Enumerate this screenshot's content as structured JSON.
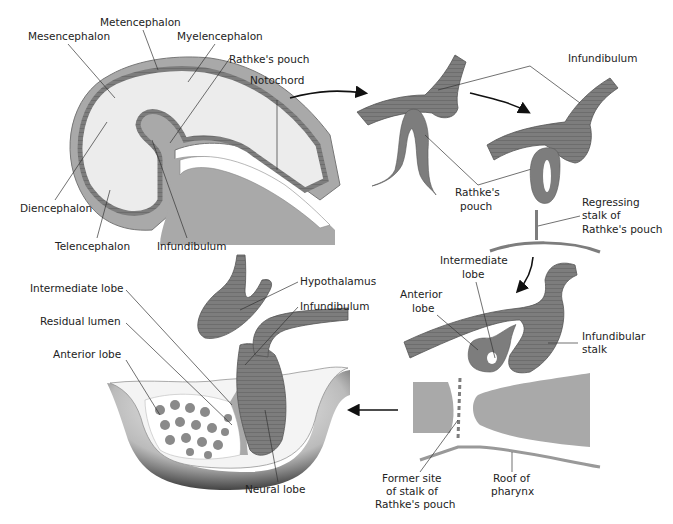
{
  "figure": {
    "panels": {
      "embryo": {
        "labels": {
          "metencephalon": "Metencephalon",
          "mesencephalon": "Mesencephalon",
          "myelencephalon": "Myelencephalon",
          "rathkes_pouch": "Rathke's pouch",
          "notochord": "Notochord",
          "diencephalon": "Diencephalon",
          "telencephalon": "Telencephalon",
          "infundibulum": "Infundibulum"
        }
      },
      "stage2": {
        "labels": {
          "rathkes_pouch_l1": "Rathke's",
          "rathkes_pouch_l2": "pouch"
        }
      },
      "stage3": {
        "labels": {
          "infundibulum": "Infundibulum",
          "regressing_l1": "Regressing",
          "regressing_l2": "stalk of",
          "regressing_l3": "Rathke's pouch"
        }
      },
      "stage4": {
        "labels": {
          "intermediate_l1": "Intermediate",
          "intermediate_l2": "lobe",
          "anterior_l1": "Anterior",
          "anterior_l2": "lobe",
          "infundibular_l1": "Infundibular",
          "infundibular_l2": "stalk",
          "former_l1": "Former site",
          "former_l2": "of stalk of",
          "former_l3": "Rathke's pouch",
          "roof_l1": "Roof of",
          "roof_l2": "pharynx"
        }
      },
      "adult": {
        "labels": {
          "intermediate_lobe": "Intermediate lobe",
          "residual_lumen": "Residual lumen",
          "anterior_lobe": "Anterior lobe",
          "hypothalamus": "Hypothalamus",
          "infundibulum": "Infundibulum",
          "neural_lobe": "Neural lobe"
        }
      }
    },
    "colors": {
      "tissue_dark": "#7d7d7d",
      "tissue_mid": "#a9a9a9",
      "tissue_light": "#ececec",
      "line": "#333333"
    }
  }
}
